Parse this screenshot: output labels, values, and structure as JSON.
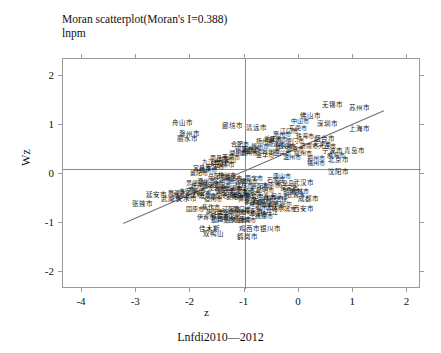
{
  "chart_data": {
    "type": "scatter",
    "title": "Moran scatterplot(Moran's I=0.388)",
    "subtitle": "lnpm",
    "xlabel": "z",
    "ylabel": "Wz",
    "caption": "Lnfdi2010—2012",
    "morans_i": 0.388,
    "xlim": [
      -4.35,
      2.25
    ],
    "ylim": [
      -2.35,
      2.35
    ],
    "xticks": [
      -4,
      -3,
      -2,
      -1,
      0,
      1,
      2
    ],
    "xticklabels": [
      "-4",
      "-3",
      "-2",
      "-1",
      "0",
      "1",
      "2"
    ],
    "yticks": [
      -2,
      -1,
      0,
      1,
      2
    ],
    "yticklabels": [
      "-2",
      "-1",
      "0",
      "1",
      "2"
    ],
    "grid": false,
    "legend": null,
    "reference_lines": {
      "horizontal_y": 0.1,
      "vertical_x": -1.0
    },
    "fit_line": {
      "x0": -3.25,
      "y0": -1.0,
      "x1": 1.55,
      "y1": 1.3,
      "slope": 0.388
    },
    "point_label_language": "zh",
    "points": [
      {
        "label": "舟山市",
        "x": -2.15,
        "y": 1.05,
        "size": 7
      },
      {
        "label": "廊坊市",
        "x": -1.22,
        "y": 0.98,
        "size": 7
      },
      {
        "label": "清远市",
        "x": -0.78,
        "y": 0.95,
        "size": 7
      },
      {
        "label": "无锡市",
        "x": 0.62,
        "y": 1.42,
        "size": 7
      },
      {
        "label": "苏州市",
        "x": 1.12,
        "y": 1.35,
        "size": 7
      },
      {
        "label": "佛山市",
        "x": 0.22,
        "y": 1.18,
        "size": 7
      },
      {
        "label": "上海市",
        "x": 1.12,
        "y": 0.92,
        "size": 7
      },
      {
        "label": "深圳市",
        "x": 0.52,
        "y": 1.02,
        "size": 7
      },
      {
        "label": "江门市",
        "x": -0.18,
        "y": 0.88,
        "size": 6
      },
      {
        "label": "中山市",
        "x": 0.02,
        "y": 1.08,
        "size": 6
      },
      {
        "label": "珠海市",
        "x": 0.12,
        "y": 0.78,
        "size": 6
      },
      {
        "label": "东莞市",
        "x": -0.02,
        "y": 0.95,
        "size": 6
      },
      {
        "label": "惠州市",
        "x": -0.32,
        "y": 0.82,
        "size": 6
      },
      {
        "label": "烟台市",
        "x": 0.48,
        "y": 0.72,
        "size": 7
      },
      {
        "label": "宁波市",
        "x": 0.62,
        "y": 0.48,
        "size": 7
      },
      {
        "label": "青岛市",
        "x": 1.02,
        "y": 0.48,
        "size": 7
      },
      {
        "label": "北京市",
        "x": 0.72,
        "y": 0.28,
        "size": 7
      },
      {
        "label": "威海市",
        "x": 0.68,
        "y": 0.38,
        "size": 6
      },
      {
        "label": "沈阳市",
        "x": 0.72,
        "y": 0.05,
        "size": 7
      },
      {
        "label": "武汉市",
        "x": 0.08,
        "y": -0.18,
        "size": 7
      },
      {
        "label": "成都市",
        "x": 0.18,
        "y": -0.52,
        "size": 7
      },
      {
        "label": "西安市",
        "x": 0.08,
        "y": -0.72,
        "size": 7
      },
      {
        "label": "哈尔滨市",
        "x": -0.28,
        "y": -0.72,
        "size": 6
      },
      {
        "label": "郑州市",
        "x": 0.32,
        "y": 0.32,
        "size": 6
      },
      {
        "label": "福州市",
        "x": 0.32,
        "y": 0.22,
        "size": 6
      },
      {
        "label": "泉州市",
        "x": 0.08,
        "y": 0.42,
        "size": 6
      },
      {
        "label": "温州市",
        "x": -0.12,
        "y": 0.35,
        "size": 6
      },
      {
        "label": "嘉兴市",
        "x": -0.28,
        "y": 0.58,
        "size": 6
      },
      {
        "label": "绍兴市",
        "x": -0.32,
        "y": 0.42,
        "size": 6
      },
      {
        "label": "台州市",
        "x": -0.52,
        "y": 0.48,
        "size": 6
      },
      {
        "label": "金华市",
        "x": -0.62,
        "y": 0.38,
        "size": 6
      },
      {
        "label": "衢州市",
        "x": -0.88,
        "y": 0.52,
        "size": 6
      },
      {
        "label": "丽水市",
        "x": -2.05,
        "y": 0.72,
        "size": 7
      },
      {
        "label": "滁州市",
        "x": -2.02,
        "y": 0.82,
        "size": 7
      },
      {
        "label": "玉林市",
        "x": -1.38,
        "y": 0.18,
        "size": 7
      },
      {
        "label": "延安市",
        "x": -2.62,
        "y": -0.42,
        "size": 7
      },
      {
        "label": "武威市",
        "x": -2.35,
        "y": -0.52,
        "size": 7
      },
      {
        "label": "天水市",
        "x": -2.08,
        "y": -0.52,
        "size": 7
      },
      {
        "label": "张掖市",
        "x": -2.88,
        "y": -0.62,
        "size": 7
      },
      {
        "label": "固原市",
        "x": -1.92,
        "y": -0.72,
        "size": 6
      },
      {
        "label": "焦作市",
        "x": -1.62,
        "y": -0.68,
        "size": 6
      },
      {
        "label": "伊春市",
        "x": -1.72,
        "y": -0.88,
        "size": 6
      },
      {
        "label": "佳木斯",
        "x": -1.65,
        "y": -1.12,
        "size": 7
      },
      {
        "label": "双鸭山",
        "x": -1.58,
        "y": -1.22,
        "size": 7
      },
      {
        "label": "鸡西市",
        "x": -0.92,
        "y": -1.12,
        "size": 7
      },
      {
        "label": "银川市",
        "x": -0.52,
        "y": -1.12,
        "size": 7
      },
      {
        "label": "鹤岗市",
        "x": -0.95,
        "y": -1.28,
        "size": 7
      },
      {
        "label": "重庆市",
        "x": -0.48,
        "y": 0.72,
        "size": 6
      },
      {
        "label": "厦门市",
        "x": -0.08,
        "y": 0.68,
        "size": 6
      },
      {
        "label": "长沙市",
        "x": -0.22,
        "y": 0.58,
        "size": 6
      },
      {
        "label": "合肥市",
        "x": -1.08,
        "y": 0.62,
        "size": 6
      },
      {
        "label": "南京市",
        "x": -0.08,
        "y": 0.52,
        "size": 6
      },
      {
        "label": "济南市",
        "x": 0.18,
        "y": 0.58,
        "size": 6
      },
      {
        "label": "天津市",
        "x": 0.42,
        "y": 0.62,
        "size": 6
      },
      {
        "label": "大连市",
        "x": 0.52,
        "y": 0.58,
        "size": 6
      },
      {
        "label": "常州市",
        "x": -0.38,
        "y": 0.72,
        "size": 6
      },
      {
        "label": "南通市",
        "x": -0.42,
        "y": 0.62,
        "size": 6
      },
      {
        "label": "扬州市",
        "x": -0.62,
        "y": 0.68,
        "size": 6
      },
      {
        "label": "徐州市",
        "x": -0.72,
        "y": 0.58,
        "size": 6
      },
      {
        "label": "盐城市",
        "x": -0.82,
        "y": 0.48,
        "size": 6
      },
      {
        "label": "泰州市",
        "x": -0.92,
        "y": 0.42,
        "size": 6
      },
      {
        "label": "镇江市",
        "x": -1.02,
        "y": 0.52,
        "size": 6
      },
      {
        "label": "湖州市",
        "x": -1.12,
        "y": 0.42,
        "size": 6
      },
      {
        "label": "芜湖市",
        "x": -1.25,
        "y": 0.35,
        "size": 6
      },
      {
        "label": "马鞍山",
        "x": -1.32,
        "y": 0.28,
        "size": 6
      },
      {
        "label": "蚌埠市",
        "x": -1.45,
        "y": 0.22,
        "size": 6
      },
      {
        "label": "安庆市",
        "x": -1.55,
        "y": 0.15,
        "size": 6
      },
      {
        "label": "九江市",
        "x": -1.62,
        "y": 0.25,
        "size": 6
      },
      {
        "label": "南昌市",
        "x": -1.48,
        "y": 0.32,
        "size": 6
      },
      {
        "label": "赣州市",
        "x": -1.68,
        "y": 0.08,
        "size": 6
      },
      {
        "label": "宜昌市",
        "x": -1.78,
        "y": 0.12,
        "size": 6
      },
      {
        "label": "襄阳市",
        "x": -1.85,
        "y": 0.02,
        "size": 6
      },
      {
        "label": "岳阳市",
        "x": -1.52,
        "y": -0.05,
        "size": 6
      },
      {
        "label": "常德市",
        "x": -1.42,
        "y": -0.12,
        "size": 6
      },
      {
        "label": "株洲市",
        "x": -1.32,
        "y": -0.02,
        "size": 6
      },
      {
        "label": "湘潭市",
        "x": -1.22,
        "y": -0.08,
        "size": 6
      },
      {
        "label": "衡阳市",
        "x": -1.12,
        "y": -0.15,
        "size": 6
      },
      {
        "label": "桂林市",
        "x": -1.02,
        "y": -0.22,
        "size": 6
      },
      {
        "label": "柳州市",
        "x": -0.92,
        "y": -0.15,
        "size": 6
      },
      {
        "label": "南宁市",
        "x": -0.82,
        "y": -0.08,
        "size": 6
      },
      {
        "label": "贵阳市",
        "x": -0.72,
        "y": -0.25,
        "size": 6
      },
      {
        "label": "昆明市",
        "x": -0.62,
        "y": -0.32,
        "size": 6
      },
      {
        "label": "太原市",
        "x": -0.52,
        "y": -0.22,
        "size": 6
      },
      {
        "label": "石家庄",
        "x": -0.42,
        "y": -0.12,
        "size": 6
      },
      {
        "label": "唐山市",
        "x": -0.32,
        "y": -0.05,
        "size": 6
      },
      {
        "label": "秦皇岛",
        "x": -0.25,
        "y": -0.18,
        "size": 6
      },
      {
        "label": "保定市",
        "x": -0.18,
        "y": -0.28,
        "size": 6
      },
      {
        "label": "邯郸市",
        "x": -0.12,
        "y": -0.35,
        "size": 6
      },
      {
        "label": "长春市",
        "x": -0.05,
        "y": -0.42,
        "size": 6
      },
      {
        "label": "吉林市",
        "x": 0.02,
        "y": -0.35,
        "size": 6
      },
      {
        "label": "包头市",
        "x": -0.35,
        "y": -0.45,
        "size": 6
      },
      {
        "label": "呼和浩特",
        "x": -0.45,
        "y": -0.52,
        "size": 6
      },
      {
        "label": "兰州市",
        "x": -0.58,
        "y": -0.48,
        "size": 6
      },
      {
        "label": "西宁市",
        "x": -0.68,
        "y": -0.55,
        "size": 6
      },
      {
        "label": "乌鲁木齐",
        "x": -0.78,
        "y": -0.45,
        "size": 6
      },
      {
        "label": "洛阳市",
        "x": -0.88,
        "y": -0.38,
        "size": 6
      },
      {
        "label": "开封市",
        "x": -0.98,
        "y": -0.32,
        "size": 6
      },
      {
        "label": "新乡市",
        "x": -1.08,
        "y": -0.42,
        "size": 6
      },
      {
        "label": "安阳市",
        "x": -1.18,
        "y": -0.48,
        "size": 6
      },
      {
        "label": "平顶山",
        "x": -1.28,
        "y": -0.42,
        "size": 6
      },
      {
        "label": "信阳市",
        "x": -1.38,
        "y": -0.35,
        "size": 6
      },
      {
        "label": "阜阳市",
        "x": -1.48,
        "y": -0.45,
        "size": 6
      },
      {
        "label": "宿州市",
        "x": -1.58,
        "y": -0.52,
        "size": 6
      },
      {
        "label": "淮南市",
        "x": -1.68,
        "y": -0.45,
        "size": 6
      },
      {
        "label": "六安市",
        "x": -1.78,
        "y": -0.38,
        "size": 6
      },
      {
        "label": "黄山市",
        "x": -1.88,
        "y": -0.32,
        "size": 6
      },
      {
        "label": "上饶市",
        "x": -1.95,
        "y": -0.42,
        "size": 6
      },
      {
        "label": "吉安市",
        "x": -2.05,
        "y": -0.35,
        "size": 6
      },
      {
        "label": "萍乡市",
        "x": -2.15,
        "y": -0.45,
        "size": 6
      },
      {
        "label": "鹰潭市",
        "x": -2.25,
        "y": -0.38,
        "size": 6
      },
      {
        "label": "景德镇",
        "x": -1.92,
        "y": -0.18,
        "size": 6
      },
      {
        "label": "抚州市",
        "x": -1.82,
        "y": -0.25,
        "size": 6
      },
      {
        "label": "漳州市",
        "x": -1.72,
        "y": -0.15,
        "size": 6
      },
      {
        "label": "莆田市",
        "x": -1.62,
        "y": -0.22,
        "size": 6
      },
      {
        "label": "龙岩市",
        "x": -1.52,
        "y": -0.28,
        "size": 6
      },
      {
        "label": "三明市",
        "x": -1.42,
        "y": -0.22,
        "size": 6
      },
      {
        "label": "南平市",
        "x": -1.32,
        "y": -0.32,
        "size": 6
      },
      {
        "label": "宁德市",
        "x": -1.22,
        "y": -0.28,
        "size": 6
      },
      {
        "label": "十堰市",
        "x": -1.12,
        "y": -0.35,
        "size": 6
      },
      {
        "label": "荆州市",
        "x": -1.05,
        "y": -0.45,
        "size": 6
      },
      {
        "label": "黄石市",
        "x": -0.95,
        "y": -0.52,
        "size": 6
      },
      {
        "label": "孝感市",
        "x": -0.85,
        "y": -0.58,
        "size": 6
      },
      {
        "label": "咸宁市",
        "x": -0.75,
        "y": -0.62,
        "size": 6
      },
      {
        "label": "鄂州市",
        "x": -0.65,
        "y": -0.68,
        "size": 6
      },
      {
        "label": "随州市",
        "x": -0.55,
        "y": -0.62,
        "size": 6
      },
      {
        "label": "大庆市",
        "x": -0.45,
        "y": -0.68,
        "size": 6
      },
      {
        "label": "齐齐哈尔",
        "x": -0.35,
        "y": -0.62,
        "size": 6
      },
      {
        "label": "牡丹江",
        "x": -0.55,
        "y": -0.78,
        "size": 6
      },
      {
        "label": "抚顺市",
        "x": -0.65,
        "y": -0.85,
        "size": 6
      },
      {
        "label": "本溪市",
        "x": -0.75,
        "y": -0.82,
        "size": 6
      },
      {
        "label": "丹东市",
        "x": -0.85,
        "y": -0.75,
        "size": 6
      },
      {
        "label": "锦州市",
        "x": -0.95,
        "y": -0.78,
        "size": 6
      },
      {
        "label": "营口市",
        "x": -1.05,
        "y": -0.72,
        "size": 6
      },
      {
        "label": "阜新市",
        "x": -1.15,
        "y": -0.78,
        "size": 6
      },
      {
        "label": "辽阳市",
        "x": -1.25,
        "y": -0.72,
        "size": 6
      },
      {
        "label": "盘锦市",
        "x": -1.35,
        "y": -0.78,
        "size": 6
      },
      {
        "label": "铁岭市",
        "x": -1.45,
        "y": -0.85,
        "size": 6
      },
      {
        "label": "朝阳市",
        "x": -1.55,
        "y": -0.78,
        "size": 6
      },
      {
        "label": "葫芦岛",
        "x": -1.45,
        "y": -0.95,
        "size": 6
      },
      {
        "label": "四平市",
        "x": -1.35,
        "y": -0.92,
        "size": 6
      },
      {
        "label": "通化市",
        "x": -1.25,
        "y": -0.88,
        "size": 6
      },
      {
        "label": "白山市",
        "x": -1.15,
        "y": -0.95,
        "size": 6
      },
      {
        "label": "松原市",
        "x": -1.05,
        "y": -0.92,
        "size": 6
      },
      {
        "label": "白城市",
        "x": -0.95,
        "y": -0.95,
        "size": 6
      }
    ]
  }
}
